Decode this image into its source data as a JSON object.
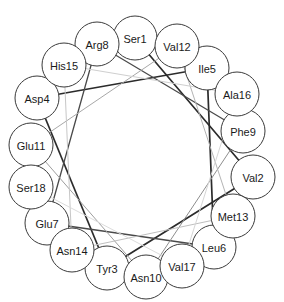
{
  "diagram": {
    "type": "helical-wheel",
    "canvas": {
      "width": 284,
      "height": 302
    },
    "wheel": {
      "center_x": 142,
      "center_y": 157,
      "radius": 115,
      "node_radius": 22
    },
    "style": {
      "background": "#ffffff",
      "node_fill": "#ffffff",
      "node_stroke": "#3a3a3a",
      "label_color": "#1a1a1a",
      "edge_dark": "#2b2b2b",
      "edge_mid": "#6f6f6f",
      "edge_light": "#b9b9b9",
      "edge_faint": "#d5d5d5"
    },
    "residues": [
      {
        "id": "res-1",
        "label": "Ser1",
        "position": 1,
        "cx": 135,
        "cy": 38,
        "r": 22
      },
      {
        "id": "res-2",
        "label": "Val2",
        "position": 2,
        "cx": 253,
        "cy": 177,
        "r": 22
      },
      {
        "id": "res-3",
        "label": "Tyr3",
        "position": 3,
        "cx": 107,
        "cy": 268,
        "r": 22
      },
      {
        "id": "res-4",
        "label": "Asp4",
        "position": 4,
        "cx": 37,
        "cy": 98,
        "r": 22
      },
      {
        "id": "res-5",
        "label": "Ile5",
        "position": 5,
        "cx": 207,
        "cy": 68,
        "r": 22
      },
      {
        "id": "res-6",
        "label": "Leu6",
        "position": 6,
        "cx": 214,
        "cy": 247,
        "r": 22
      },
      {
        "id": "res-7",
        "label": "Glu7",
        "position": 7,
        "cx": 47,
        "cy": 223,
        "r": 22
      },
      {
        "id": "res-8",
        "label": "Arg8",
        "position": 8,
        "cx": 97,
        "cy": 44,
        "r": 22
      },
      {
        "id": "res-9",
        "label": "Phe9",
        "position": 9,
        "cx": 243,
        "cy": 131,
        "r": 22
      },
      {
        "id": "res-10",
        "label": "Asn10",
        "position": 10,
        "cx": 146,
        "cy": 277,
        "r": 22
      },
      {
        "id": "res-11",
        "label": "Glu11",
        "position": 11,
        "cx": 31,
        "cy": 145,
        "r": 22
      },
      {
        "id": "res-12",
        "label": "Val12",
        "position": 12,
        "cx": 177,
        "cy": 46,
        "r": 22
      },
      {
        "id": "res-13",
        "label": "Met13",
        "position": 13,
        "cx": 233,
        "cy": 216,
        "r": 22
      },
      {
        "id": "res-14",
        "label": "Asn14",
        "position": 14,
        "cx": 72,
        "cy": 250,
        "r": 22
      },
      {
        "id": "res-15",
        "label": "His15",
        "position": 15,
        "cx": 64,
        "cy": 65,
        "r": 22
      },
      {
        "id": "res-16",
        "label": "Ala16",
        "position": 16,
        "cx": 237,
        "cy": 94,
        "r": 22
      },
      {
        "id": "res-17",
        "label": "Val17",
        "position": 17,
        "cx": 182,
        "cy": 266,
        "r": 22
      },
      {
        "id": "res-18",
        "label": "Ser18",
        "position": 18,
        "cx": 31,
        "cy": 187,
        "r": 22
      }
    ],
    "connections": [
      {
        "from": "Ser1",
        "to": "Val2",
        "color": "#2b2b2b",
        "width": 1.7
      },
      {
        "from": "Val2",
        "to": "Tyr3",
        "color": "#2b2b2b",
        "width": 1.7
      },
      {
        "from": "Tyr3",
        "to": "Asp4",
        "color": "#2b2b2b",
        "width": 1.7
      },
      {
        "from": "Asp4",
        "to": "Ile5",
        "color": "#2b2b2b",
        "width": 1.7
      },
      {
        "from": "Ile5",
        "to": "Leu6",
        "color": "#2b2b2b",
        "width": 1.7
      },
      {
        "from": "Leu6",
        "to": "Glu7",
        "color": "#4a4a4a",
        "width": 1.3
      },
      {
        "from": "Glu7",
        "to": "Arg8",
        "color": "#4a4a4a",
        "width": 1.3
      },
      {
        "from": "Arg8",
        "to": "Phe9",
        "color": "#4a4a4a",
        "width": 1.3
      },
      {
        "from": "Phe9",
        "to": "Asn10",
        "color": "#8e8e8e",
        "width": 1.0
      },
      {
        "from": "Asn10",
        "to": "Glu11",
        "color": "#9e9e9e",
        "width": 1.0
      },
      {
        "from": "Glu11",
        "to": "Val12",
        "color": "#a8a8a8",
        "width": 1.0
      },
      {
        "from": "Val12",
        "to": "Met13",
        "color": "#b4b4b4",
        "width": 1.0
      },
      {
        "from": "Met13",
        "to": "Asn14",
        "color": "#bfbfbf",
        "width": 1.0
      },
      {
        "from": "Asn14",
        "to": "His15",
        "color": "#c7c7c7",
        "width": 1.0
      },
      {
        "from": "His15",
        "to": "Ala16",
        "color": "#cfcfcf",
        "width": 1.0
      },
      {
        "from": "Ala16",
        "to": "Val17",
        "color": "#d6d6d6",
        "width": 1.0
      },
      {
        "from": "Val17",
        "to": "Ser18",
        "color": "#dcdcdc",
        "width": 1.0
      }
    ]
  }
}
